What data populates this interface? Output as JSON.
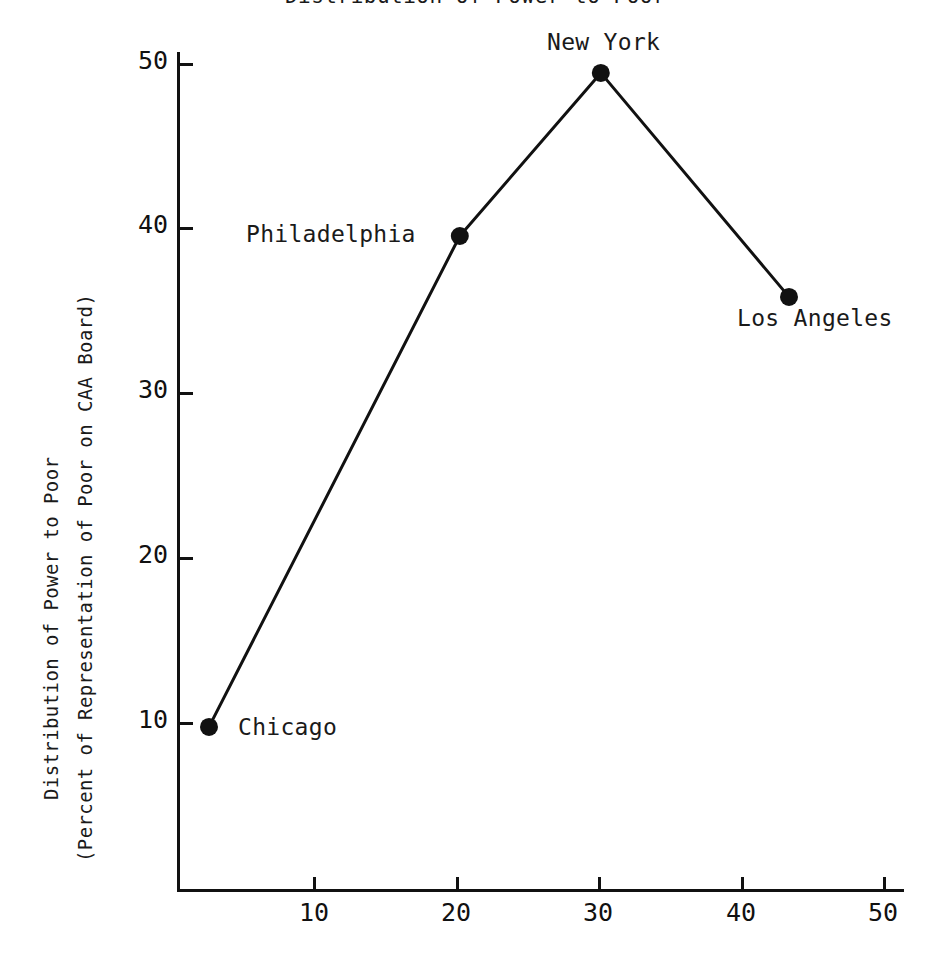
{
  "chart_data": {
    "type": "line",
    "title": "Distribution of Power to Poor",
    "subtitle": "",
    "xlabel": "",
    "ylabel": "Distribution of Power to Poor",
    "ylabel_line2": "(Percent of Representation of Poor on CAA Board)",
    "xlim": [
      0,
      53
    ],
    "ylim": [
      0,
      53
    ],
    "grid": false,
    "legend": "none",
    "xticks": [
      10,
      20,
      30,
      40,
      50
    ],
    "xticklabels": [
      "10",
      "20",
      "30",
      "40",
      "50"
    ],
    "yticks": [
      10,
      20,
      30,
      40,
      50
    ],
    "yticklabels": [
      "10",
      "20",
      "30",
      "40",
      "50"
    ],
    "marker": "filled-circle",
    "line_color": "#111111",
    "marker_color": "#111111",
    "series": [
      {
        "name": "CAA Board Representation",
        "points": [
          {
            "label": "Chicago",
            "x": 2.7,
            "y": 9.7,
            "label_pos": "right"
          },
          {
            "label": "Philadelphia",
            "x": 20.3,
            "y": 39.5,
            "label_pos": "left"
          },
          {
            "label": "New York",
            "x": 30.2,
            "y": 49.4,
            "label_pos": "above"
          },
          {
            "label": "Los Angeles",
            "x": 43.4,
            "y": 35.8,
            "label_pos": "below"
          }
        ]
      }
    ],
    "annotations": [
      {
        "text": "Chicago",
        "x": 2.7,
        "y": 9.7
      },
      {
        "text": "Philadelphia",
        "x": 20.3,
        "y": 39.5
      },
      {
        "text": "New York",
        "x": 30.2,
        "y": 49.4
      },
      {
        "text": "Los Angeles",
        "x": 43.4,
        "y": 35.8
      }
    ]
  },
  "axes": {
    "y_tick_labels": [
      "50",
      "40",
      "30",
      "20",
      "10"
    ],
    "x_tick_labels": [
      "10",
      "20",
      "30",
      "40",
      "50"
    ]
  },
  "ylabel": {
    "line1": "Distribution of Power to Poor",
    "line2": "(Percent of Representation of Poor on CAA Board)"
  },
  "title": {
    "text": "Distribution of Power to Poor"
  },
  "point_labels": {
    "chicago": "Chicago",
    "philadelphia": "Philadelphia",
    "new_york": "New York",
    "los_angeles": "Los Angeles"
  }
}
